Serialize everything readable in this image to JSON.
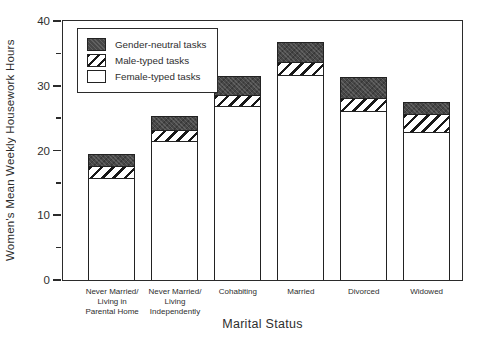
{
  "chart_data": {
    "type": "bar",
    "stacked": true,
    "title": "",
    "xlabel": "Marital Status",
    "ylabel": "Women's Mean Weekly Housework Hours",
    "ylim": [
      0,
      40
    ],
    "y_major_ticks": [
      0,
      10,
      20,
      30,
      40
    ],
    "y_minor_ticks": [
      5,
      15,
      25,
      35
    ],
    "grid": false,
    "legend_position": "top-left",
    "categories": [
      "Never Married/\nLiving in\nParental Home",
      "Never Married/\nLiving\nIndependently",
      "Cohabiting",
      "Married",
      "Divorced",
      "Widowed"
    ],
    "series": [
      {
        "name": "Female-typed tasks",
        "pattern": "white",
        "values": [
          15.5,
          21.2,
          26.6,
          31.4,
          25.8,
          22.6
        ]
      },
      {
        "name": "Male-typed tasks",
        "pattern": "diagonal-hatch",
        "values": [
          1.9,
          1.7,
          1.7,
          2.0,
          2.1,
          2.8
        ]
      },
      {
        "name": "Gender-neutral tasks",
        "pattern": "dark-speckle",
        "values": [
          1.8,
          2.2,
          2.9,
          3.1,
          3.2,
          1.9
        ]
      }
    ],
    "totals": [
      19.2,
      25.1,
      31.2,
      36.5,
      31.1,
      27.3
    ]
  },
  "colors": {
    "frame": "#2b2b2b",
    "bar_border": "#222222",
    "neutral_fill": "#474747",
    "hatch_line": "#181818",
    "background": "#ffffff",
    "text": "#2e2e2e"
  }
}
